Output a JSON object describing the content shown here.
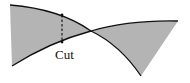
{
  "diagram": {
    "type": "curve-intersection-cut",
    "fill_color": "#b4b4b4",
    "stroke_color": "#111111",
    "cut_label": "Cut",
    "regions": [
      {
        "name": "left-shaded-region",
        "description": "region bounded by left vertical edge, upper curve and lower curve up to crossing"
      },
      {
        "name": "right-shaded-region",
        "description": "region between curves after crossing point, ending at right tip"
      }
    ],
    "curves": [
      {
        "name": "upper-curve",
        "from": [
          10,
          5
        ],
        "through": [
          91,
          31
        ],
        "to": [
          141,
          76
        ]
      },
      {
        "name": "lower-curve",
        "from": [
          12,
          66
        ],
        "through": [
          91,
          31
        ],
        "to": [
          178,
          21
        ]
      }
    ],
    "cut_line": {
      "x": 62,
      "y_top": 15,
      "y_bottom": 42,
      "style": "dashed"
    },
    "crossing_point": [
      91,
      31
    ]
  }
}
